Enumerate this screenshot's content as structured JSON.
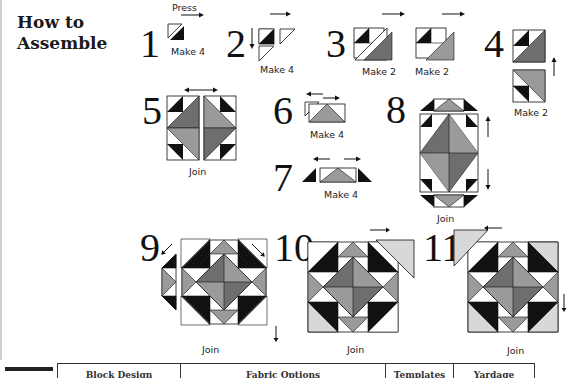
{
  "heading": {
    "line1": "How to",
    "line2": "Assemble"
  },
  "colors": {
    "dark": "#111111",
    "medium_gray": "#6e6e6e",
    "light_gray": "#9a9a9a",
    "pale": "#d8d8d8",
    "white": "#ffffff"
  },
  "steps": [
    {
      "number": "1",
      "label": "Press",
      "caption": "Make 4"
    },
    {
      "number": "2",
      "caption": "Make 4"
    },
    {
      "number": "3",
      "caption_a": "Make 2",
      "caption_b": "Make 2"
    },
    {
      "number": "4",
      "caption": "Make 2"
    },
    {
      "number": "5",
      "caption": "Join"
    },
    {
      "number": "6",
      "caption": "Make 4"
    },
    {
      "number": "7",
      "caption": "Make 4"
    },
    {
      "number": "8",
      "caption": "Join"
    },
    {
      "number": "9",
      "caption": "Join"
    },
    {
      "number": "10",
      "caption": "Join"
    },
    {
      "number": "11",
      "caption": "Join"
    }
  ],
  "table": {
    "headers": [
      "Block Design",
      "Fabric Options",
      "Templates",
      "Yardage"
    ]
  }
}
